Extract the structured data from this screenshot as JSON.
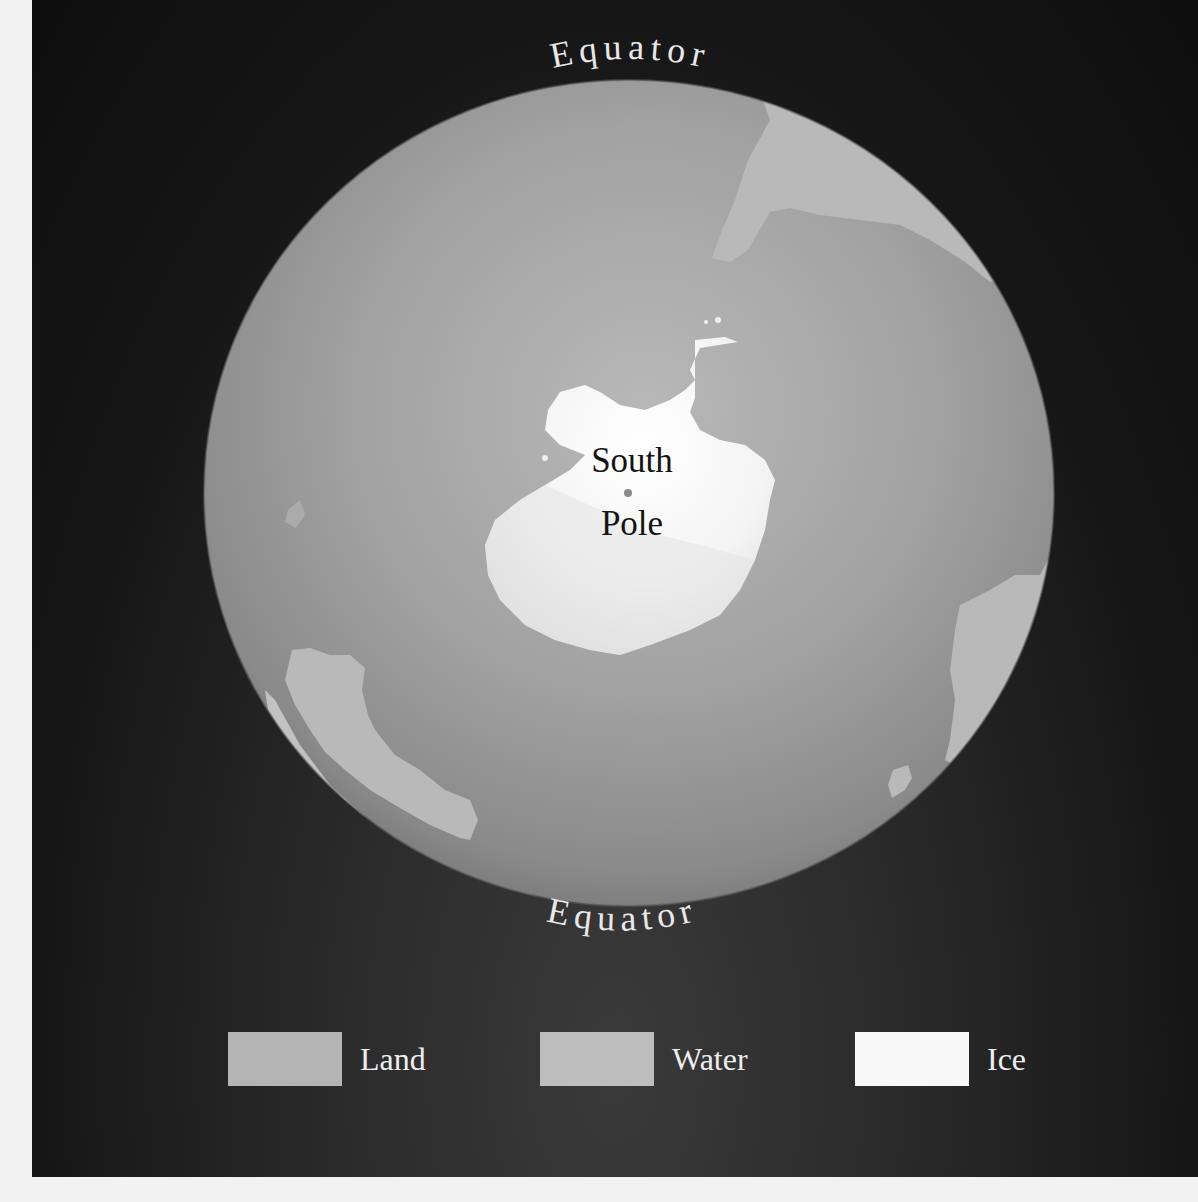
{
  "map": {
    "title_top": "Equator",
    "title_bottom": "Equator",
    "center_label_line1": "South",
    "center_label_line2": "Pole",
    "view": "Globe viewed from below the South Pole",
    "colors": {
      "background": "#141414",
      "land": "#b5b5b5",
      "water": "#9c9c9c",
      "ice": "#f6f6f6"
    }
  },
  "legend": {
    "items": [
      {
        "label": "Land",
        "color": "#b4b4b4"
      },
      {
        "label": "Water",
        "color": "#bdbdbd"
      },
      {
        "label": "Ice",
        "color": "#f8f8f8"
      }
    ]
  }
}
